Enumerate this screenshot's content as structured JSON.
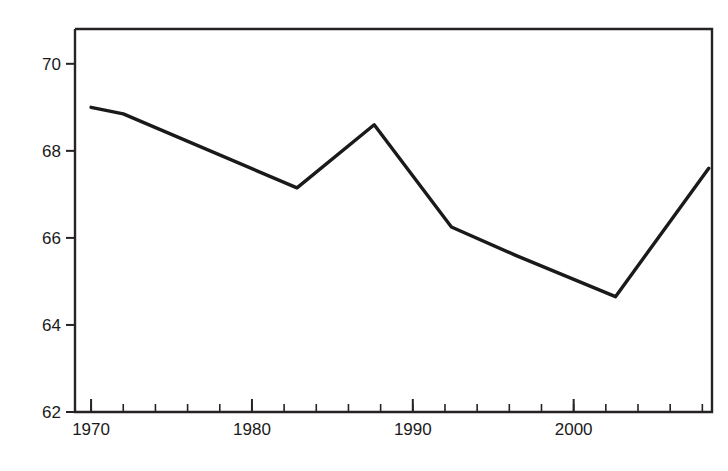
{
  "chart_data": {
    "type": "line",
    "title": "",
    "xlabel": "",
    "ylabel": "ロシア人の平均寿命",
    "ylabel_sub": "（出生時平均余命、歳）",
    "xlim": [
      1969,
      2008.6
    ],
    "ylim": [
      62,
      70.8
    ],
    "grid": false,
    "legend": null,
    "yticks": [
      62,
      64,
      66,
      68,
      70
    ],
    "ytick_labels": [
      "62",
      "64",
      "66",
      "68",
      "70"
    ],
    "xticks": [
      1970,
      1980,
      1990,
      2000
    ],
    "xtick_labels": [
      "1970",
      "1980",
      "1990",
      "2000"
    ],
    "x_minor_tick_step": 2,
    "series": [
      {
        "name": "ロシア人の平均寿命",
        "color": "#1a1a1a",
        "x": [
          1970,
          1972,
          1982.8,
          1987.6,
          1992.4,
          1996.4,
          2002.6,
          2008.4
        ],
        "values": [
          69.0,
          68.85,
          67.15,
          68.6,
          66.25,
          65.6,
          64.65,
          67.6
        ]
      }
    ]
  },
  "axis": {
    "ytick_0": "62",
    "ytick_1": "64",
    "ytick_2": "66",
    "ytick_3": "68",
    "ytick_4": "70",
    "xtick_0": "1970",
    "xtick_1": "1980",
    "xtick_2": "1990",
    "xtick_3": "2000"
  },
  "colors": {
    "line": "#1a1a1a",
    "frame": "#262322",
    "text": "#1a1a1a",
    "background": "#ffffff"
  }
}
